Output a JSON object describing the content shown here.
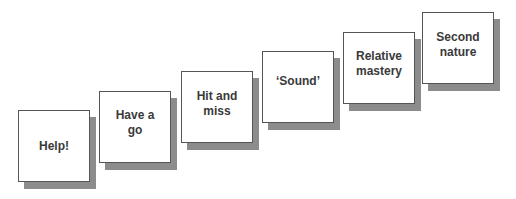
{
  "diagram": {
    "type": "staircase",
    "colors": {
      "box_fill": "#ffffff",
      "box_border": "#555555",
      "shadow": "#8c8c8c",
      "text": "#3a3a3a"
    },
    "steps": [
      {
        "label": "Help!",
        "x": 18,
        "y": 110
      },
      {
        "label": "Have a go",
        "x": 99,
        "y": 91
      },
      {
        "label": "Hit and miss",
        "x": 181,
        "y": 71
      },
      {
        "label": "‘Sound’",
        "x": 262,
        "y": 51
      },
      {
        "label": "Relative mastery",
        "x": 343,
        "y": 32
      },
      {
        "label": "Second nature",
        "x": 422,
        "y": 12
      }
    ]
  }
}
